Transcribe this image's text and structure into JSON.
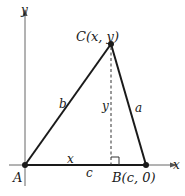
{
  "diagram": {
    "axes": {
      "x_label": "x",
      "y_label": "y"
    },
    "points": {
      "A": {
        "label": "A"
      },
      "B": {
        "label": "B(c, 0)"
      },
      "C": {
        "label": "C(x, y)"
      }
    },
    "sides": {
      "a": "a",
      "b": "b",
      "c": "c"
    },
    "segments": {
      "height": "y",
      "base_part": "x"
    },
    "colors": {
      "line": "#1a1a1a",
      "axis": "#555555",
      "background": "#ffffff"
    }
  }
}
